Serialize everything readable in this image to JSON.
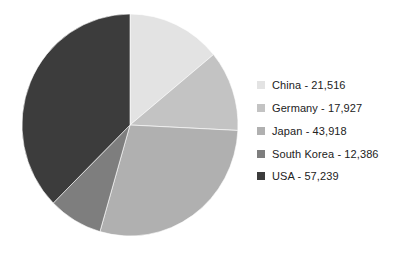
{
  "chart_data": {
    "type": "pie",
    "title": "",
    "subtitle": "",
    "xlabel": "",
    "ylabel": "",
    "legend_position": "right",
    "grid": false,
    "start_angle_deg": 0,
    "direction": "clockwise",
    "total": 152986,
    "categories": [
      "China",
      "Germany",
      "Japan",
      "South Korea",
      "USA"
    ],
    "values": [
      21516,
      17927,
      43918,
      12386,
      57239
    ],
    "value_labels": [
      "21,516",
      "17,927",
      "43,918",
      "12,386",
      "57,239"
    ],
    "percentages": [
      14.1,
      11.7,
      28.7,
      8.1,
      37.4
    ],
    "angles_deg": [
      50.6,
      42.2,
      103.4,
      29.1,
      134.7
    ],
    "colors": [
      "#e3e3e3",
      "#c3c3c3",
      "#b0b0b0",
      "#7e7e7e",
      "#3c3c3c"
    ],
    "slices": [
      {
        "label": "China",
        "value": 21516,
        "value_label": "21,516",
        "legend_text": "China - 21,516",
        "color": "#e3e3e3",
        "percent": 14.1,
        "angle_deg": 50.6
      },
      {
        "label": "Germany",
        "value": 17927,
        "value_label": "17,927",
        "legend_text": "Germany - 17,927",
        "color": "#c3c3c3",
        "percent": 11.7,
        "angle_deg": 42.2
      },
      {
        "label": "Japan",
        "value": 43918,
        "value_label": "43,918",
        "legend_text": "Japan - 43,918",
        "color": "#b0b0b0",
        "percent": 28.7,
        "angle_deg": 103.4
      },
      {
        "label": "South Korea",
        "value": 12386,
        "value_label": "12,386",
        "legend_text": "South Korea - 12,386",
        "color": "#7e7e7e",
        "percent": 8.1,
        "angle_deg": 29.1
      },
      {
        "label": "USA",
        "value": 57239,
        "value_label": "57,239",
        "legend_text": "USA - 57,239",
        "color": "#3c3c3c",
        "percent": 37.4,
        "angle_deg": 134.7
      }
    ]
  },
  "legend": {
    "items": [
      {
        "label": "China - 21,516",
        "color": "#e3e3e3"
      },
      {
        "label": "Germany - 17,927",
        "color": "#c3c3c3"
      },
      {
        "label": "Japan - 43,918",
        "color": "#b0b0b0"
      },
      {
        "label": "South Korea - 12,386",
        "color": "#7e7e7e"
      },
      {
        "label": "USA - 57,239",
        "color": "#3c3c3c"
      }
    ]
  },
  "canvas": {
    "background": "#ffffff",
    "pie": {
      "cx": 109,
      "cy": 111,
      "rx": 108,
      "ry": 111
    }
  }
}
